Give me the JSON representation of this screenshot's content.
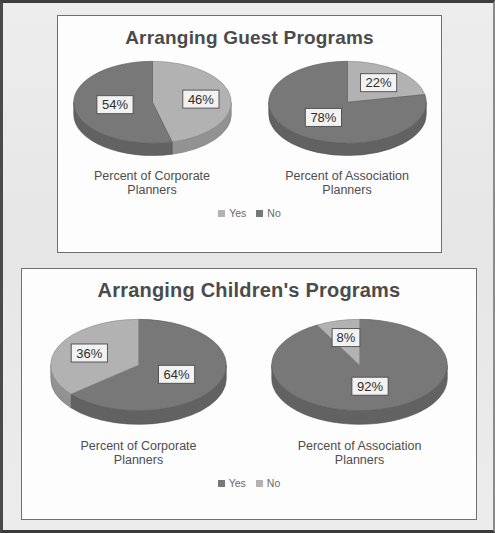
{
  "page": {
    "background_color": "#e9e9e9",
    "panel_background_color": "#fcfcfc"
  },
  "colors": {
    "light_gray": "#b2b2b2",
    "light_gray_side": "#9a9a9a",
    "dark_gray": "#787878",
    "dark_gray_side": "#5f5f5f",
    "title_text": "#4b4b4b",
    "label_text": "#4d4d4d",
    "legend_text": "#6a6a6a",
    "panel_border": "#6f6f6f"
  },
  "charts": [
    {
      "id": "guest",
      "title": "Arranging Guest Programs",
      "legend": [
        {
          "label": "Yes",
          "color": "#b2b2b2"
        },
        {
          "label": "No",
          "color": "#787878"
        }
      ],
      "pies": [
        {
          "category": "Percent of Corporate Planners",
          "category_line1": "Percent of Corporate",
          "category_line2": "Planners",
          "slices": [
            {
              "name": "Yes",
              "value": 46,
              "label": "46%",
              "color": "#b2b2b2"
            },
            {
              "name": "No",
              "value": 54,
              "label": "54%",
              "color": "#787878"
            }
          ]
        },
        {
          "category": "Percent of Association Planners",
          "category_line1": "Percent of Association",
          "category_line2": "Planners",
          "slices": [
            {
              "name": "Yes",
              "value": 22,
              "label": "22%",
              "color": "#b2b2b2"
            },
            {
              "name": "No",
              "value": 78,
              "label": "78%",
              "color": "#787878"
            }
          ]
        }
      ]
    },
    {
      "id": "children",
      "title": "Arranging Children's Programs",
      "legend": [
        {
          "label": "Yes",
          "color": "#787878"
        },
        {
          "label": "No",
          "color": "#b2b2b2"
        }
      ],
      "pies": [
        {
          "category": "Percent of Corporate Planners",
          "category_line1": "Percent of Corporate",
          "category_line2": "Planners",
          "slices": [
            {
              "name": "Yes",
              "value": 64,
              "label": "64%",
              "color": "#787878"
            },
            {
              "name": "No",
              "value": 36,
              "label": "36%",
              "color": "#b2b2b2"
            }
          ]
        },
        {
          "category": "Percent of Association Planners",
          "category_line1": "Percent of Association",
          "category_line2": "Planners",
          "slices": [
            {
              "name": "Yes",
              "value": 92,
              "label": "92%",
              "color": "#787878"
            },
            {
              "name": "No",
              "value": 8,
              "label": "8%",
              "color": "#b2b2b2"
            }
          ]
        }
      ]
    }
  ],
  "chart_data": [
    {
      "type": "pie",
      "title": "Arranging Guest Programs",
      "legend_entries": [
        "Yes",
        "No"
      ],
      "legend_position": "bottom",
      "series": [
        {
          "name": "Percent of Corporate Planners",
          "categories": [
            "Yes",
            "No"
          ],
          "values": [
            46,
            54
          ]
        },
        {
          "name": "Percent of Association Planners",
          "categories": [
            "Yes",
            "No"
          ],
          "values": [
            22,
            78
          ]
        }
      ]
    },
    {
      "type": "pie",
      "title": "Arranging Children's Programs",
      "legend_entries": [
        "Yes",
        "No"
      ],
      "legend_position": "bottom",
      "series": [
        {
          "name": "Percent of Corporate Planners",
          "categories": [
            "Yes",
            "No"
          ],
          "values": [
            64,
            36
          ]
        },
        {
          "name": "Percent of Association Planners",
          "categories": [
            "Yes",
            "No"
          ],
          "values": [
            92,
            8
          ]
        }
      ]
    }
  ]
}
